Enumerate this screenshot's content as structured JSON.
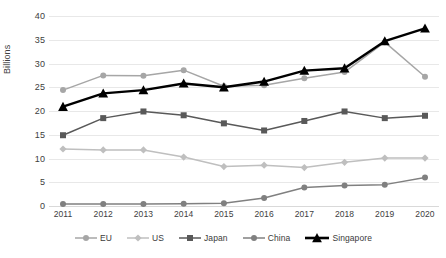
{
  "chart_data": {
    "type": "line",
    "title": "",
    "xlabel": "",
    "ylabel": "Billions",
    "categories": [
      "2011",
      "2012",
      "2013",
      "2014",
      "2015",
      "2016",
      "2017",
      "2018",
      "2019",
      "2020"
    ],
    "ylim": [
      0,
      40
    ],
    "ytick_step": 5,
    "yticks": [
      "40",
      "35",
      "30",
      "25",
      "20",
      "15",
      "10",
      "5",
      "0"
    ],
    "grid": true,
    "legend_position": "bottom",
    "series": [
      {
        "name": "EU",
        "marker": "circle",
        "color": "#a6a6a6",
        "values": [
          24.4,
          27.5,
          27.4,
          28.6,
          25.2,
          25.4,
          26.9,
          28.2,
          34.5,
          27.2
        ]
      },
      {
        "name": "US",
        "marker": "diamond",
        "color": "#bfbfbf",
        "values": [
          12.0,
          11.8,
          11.8,
          10.3,
          8.3,
          8.6,
          8.1,
          9.2,
          10.1,
          10.1
        ]
      },
      {
        "name": "Japan",
        "marker": "square",
        "color": "#595959",
        "values": [
          14.9,
          18.5,
          19.9,
          19.1,
          17.4,
          15.9,
          17.9,
          19.9,
          18.5,
          19.0
        ]
      },
      {
        "name": "China",
        "marker": "circle",
        "color": "#808080",
        "values": [
          0.4,
          0.4,
          0.4,
          0.5,
          0.6,
          1.7,
          3.9,
          4.3,
          4.5,
          6.0
        ]
      },
      {
        "name": "Singapore",
        "marker": "triangle",
        "color": "#000000",
        "values": [
          20.9,
          23.7,
          24.4,
          25.8,
          25.0,
          26.2,
          28.5,
          29.0,
          34.7,
          37.4
        ]
      }
    ]
  }
}
